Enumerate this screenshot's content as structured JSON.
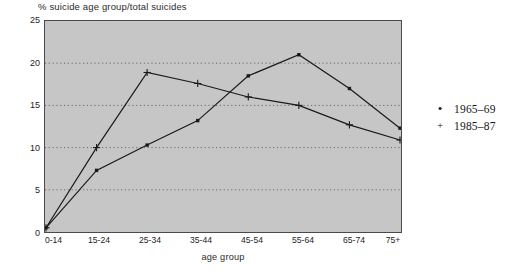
{
  "chart_data": {
    "type": "line",
    "title": "% suicide age group/total suicides",
    "xlabel": "age group",
    "ylabel": "",
    "categories": [
      "0-14",
      "15-24",
      "25-34",
      "35-44",
      "45-54",
      "55-64",
      "65-74",
      "75+"
    ],
    "series": [
      {
        "name": "1965–69",
        "marker": "dot",
        "values": [
          0.5,
          7.3,
          10.3,
          13.2,
          18.5,
          21.0,
          17.0,
          12.3
        ]
      },
      {
        "name": "1985–87",
        "marker": "plus",
        "values": [
          0.5,
          10.0,
          18.9,
          17.6,
          16.0,
          15.0,
          12.7,
          10.9
        ]
      }
    ],
    "ylim": [
      0,
      25
    ],
    "yticks": [
      0,
      5,
      10,
      15,
      20,
      25
    ],
    "ytick_labels": [
      "0",
      "5",
      "10",
      "15",
      "20",
      "25"
    ],
    "grid": true,
    "grid_style": "dotted-horizontal",
    "legend_position": "right",
    "plot_background": "#c6c6c6",
    "line_color": "#1a1a1a",
    "grid_color": "#6b6b6b",
    "axis_color": "#4a4a4a"
  },
  "legend": {
    "entries": [
      {
        "marker": "•",
        "label": "1965–69"
      },
      {
        "marker": "+",
        "label": "1985–87"
      }
    ]
  }
}
